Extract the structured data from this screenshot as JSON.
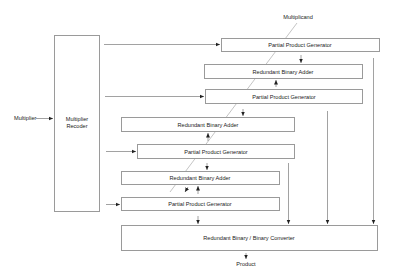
{
  "diagram": {
    "type": "block-diagram",
    "inputs": {
      "multiplier": "Multiplier",
      "multiplicand": "Multiplicand"
    },
    "output": "Product",
    "recoder": {
      "line1": "Multiplier",
      "line2": "Recoder"
    },
    "blocks": [
      {
        "id": "ppg1",
        "label": "Partial Product Generator"
      },
      {
        "id": "rba1",
        "label": "Redundant Binary Adder"
      },
      {
        "id": "ppg2",
        "label": "Partial Product Generator"
      },
      {
        "id": "rba2",
        "label": "Redundant Binary Adder"
      },
      {
        "id": "ppg3",
        "label": "Partial Product Generator"
      },
      {
        "id": "rba3",
        "label": "Redundant Binary Adder"
      },
      {
        "id": "ppg4",
        "label": "Partial Product Generator"
      },
      {
        "id": "converter",
        "label": "Redundant Binary / Binary Converter"
      }
    ],
    "colors": {
      "box_stroke": "#9a9a9a",
      "line": "#8a8a8a",
      "text": "#222222",
      "background": "#ffffff"
    }
  }
}
